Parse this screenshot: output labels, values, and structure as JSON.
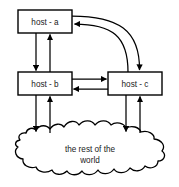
{
  "diagram": {
    "title": "",
    "background_color": "#ffffff",
    "stroke_color": "#000000",
    "text_color": "#1a1a1a",
    "nodes": [
      {
        "id": "host-a",
        "label": "host - a",
        "shape": "rectangle",
        "x": 18,
        "y": 10,
        "width": 54,
        "height": 23
      },
      {
        "id": "host-b",
        "label": "host - b",
        "shape": "rectangle",
        "x": 18,
        "y": 72,
        "width": 54,
        "height": 23
      },
      {
        "id": "host-c",
        "label": "host - c",
        "shape": "rectangle",
        "x": 108,
        "y": 72,
        "width": 54,
        "height": 23
      }
    ],
    "cloud": {
      "id": "rest-of-the-world",
      "label_line1": "the rest of the",
      "label_line2": "world",
      "shape": "cloud"
    },
    "edges": [
      {
        "id": "a-to-b",
        "from": "host-a",
        "to": "host-b",
        "direction": "down",
        "style": "straight"
      },
      {
        "id": "b-to-a",
        "from": "host-b",
        "to": "host-a",
        "direction": "up",
        "style": "straight"
      },
      {
        "id": "b-to-c",
        "from": "host-b",
        "to": "host-c",
        "direction": "right",
        "style": "straight"
      },
      {
        "id": "c-to-b",
        "from": "host-c",
        "to": "host-b",
        "direction": "left",
        "style": "straight"
      },
      {
        "id": "a-to-c",
        "from": "host-a",
        "to": "host-c",
        "direction": "down",
        "style": "curved"
      },
      {
        "id": "c-to-a",
        "from": "host-c",
        "to": "host-a",
        "direction": "left",
        "style": "curved"
      },
      {
        "id": "b-to-cloud",
        "from": "host-b",
        "to": "rest-of-the-world",
        "direction": "down",
        "style": "straight"
      },
      {
        "id": "cloud-to-b",
        "from": "rest-of-the-world",
        "to": "host-b",
        "direction": "up",
        "style": "straight"
      },
      {
        "id": "c-to-cloud",
        "from": "host-c",
        "to": "rest-of-the-world",
        "direction": "down",
        "style": "straight"
      },
      {
        "id": "cloud-to-c",
        "from": "rest-of-the-world",
        "to": "host-c",
        "direction": "up",
        "style": "straight"
      }
    ]
  }
}
